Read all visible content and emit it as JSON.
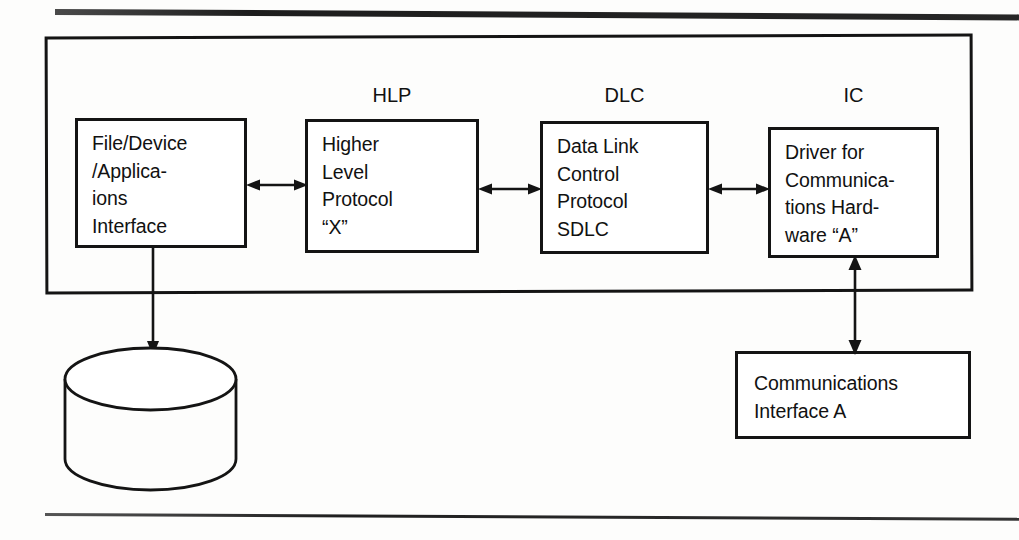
{
  "figure": {
    "stroke_color": "#141414",
    "background_color": "#fdfdfc"
  },
  "container": {
    "name": "system-boundary"
  },
  "group_labels": {
    "hlp": "HLP",
    "dlc": "DLC",
    "ic": "IC"
  },
  "boxes": {
    "file_device": {
      "lines": [
        "File/Device",
        "/Applica-",
        "ions",
        "Interface"
      ]
    },
    "higher_level_protocol": {
      "lines": [
        "Higher",
        "Level",
        "Protocol",
        "“X”"
      ]
    },
    "data_link_control": {
      "lines": [
        "Data Link",
        "Control",
        "Protocol",
        "SDLC"
      ]
    },
    "driver": {
      "lines": [
        "Driver for",
        "Communica-",
        "tions Hard-",
        "ware “A”"
      ]
    },
    "comm_interface": {
      "lines": [
        "Communications",
        "Interface A"
      ]
    }
  },
  "storage": {
    "name": "disk-storage-cylinder",
    "label": ""
  },
  "connectors": {
    "file_to_hlp": "bidirectional",
    "hlp_to_dlc": "bidirectional",
    "dlc_to_ic": "bidirectional",
    "file_to_storage": "downward",
    "ic_to_comm_interface": "bidirectional"
  }
}
